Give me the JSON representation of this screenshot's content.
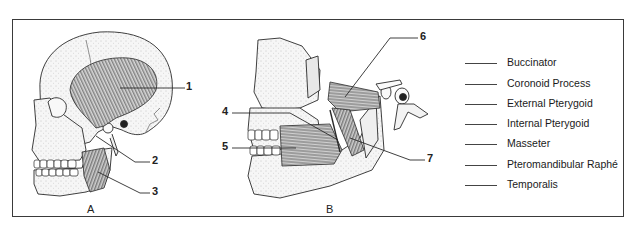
{
  "figure": {
    "panels": [
      {
        "id": "A",
        "label": "A",
        "description": "Lateral view of skull with temporalis and masseter muscles"
      },
      {
        "id": "B",
        "label": "B",
        "description": "Lateral view with mandible ramus cut away showing pterygoid and buccinator muscles"
      }
    ],
    "callouts": [
      {
        "number": "1",
        "panel": "A"
      },
      {
        "number": "2",
        "panel": "A"
      },
      {
        "number": "3",
        "panel": "A"
      },
      {
        "number": "4",
        "panel": "B"
      },
      {
        "number": "5",
        "panel": "B"
      },
      {
        "number": "6",
        "panel": "B"
      },
      {
        "number": "7",
        "panel": "B"
      }
    ]
  },
  "legend": {
    "items": [
      {
        "label": "Buccinator"
      },
      {
        "label": "Coronoid Process"
      },
      {
        "label": "External Pterygoid"
      },
      {
        "label": "Internal Pterygoid"
      },
      {
        "label": "Masseter"
      },
      {
        "label": "Pteromandibular Raphé"
      },
      {
        "label": "Temporalis"
      }
    ]
  },
  "colors": {
    "line": "#2a2a2a",
    "bone_fill": "#f1f1f1",
    "muscle": "#555555"
  }
}
